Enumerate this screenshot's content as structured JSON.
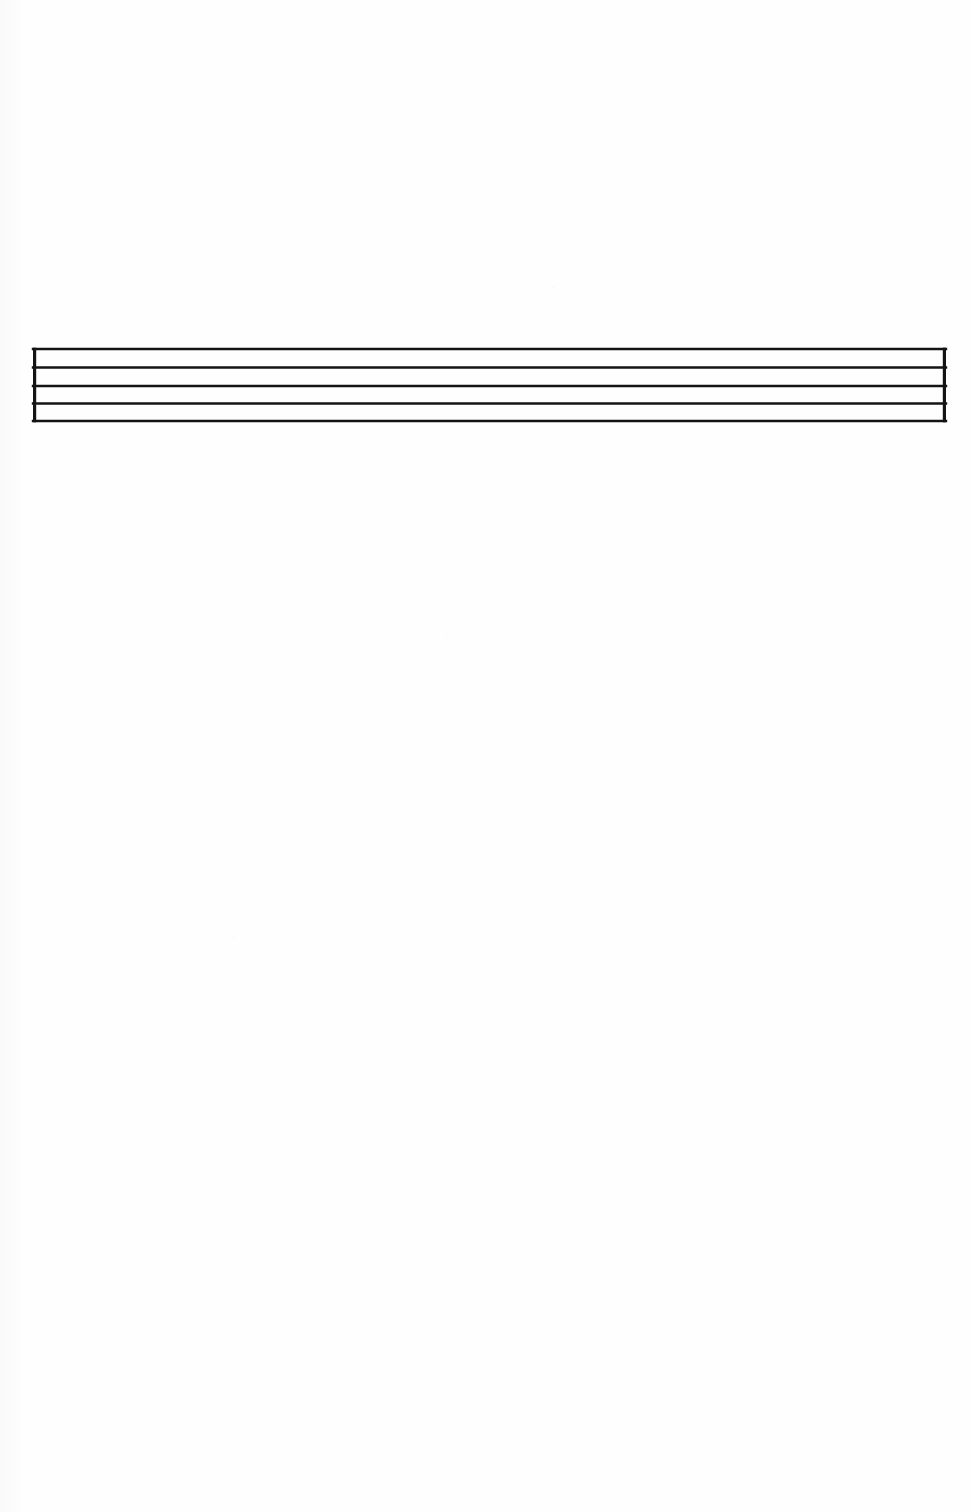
{
  "document": {
    "kind": "scanned-sheet-music-page",
    "page_background_color": "#fefefe",
    "ink_color": "#141414",
    "width": 971,
    "height": 1512,
    "visible_text": "",
    "caption": ""
  },
  "staff": {
    "label": "blank musical staff",
    "line_count": 5,
    "has_left_barline": true,
    "has_right_barline": true,
    "has_clef": false,
    "has_time_signature": false,
    "has_key_signature": false,
    "has_notes": false,
    "has_rests": false,
    "left_x": 33,
    "right_x": 946,
    "top_y": 349,
    "bottom_y": 421,
    "line_thickness": 2.6,
    "barline_thickness": 3.2,
    "line_spacing": 18,
    "line_y_positions": [
      349,
      367.5,
      386,
      403.5,
      421
    ],
    "barline_x_positions": [
      34.6,
      944.4
    ],
    "color": "#141414"
  },
  "chart_data": {
    "type": "line",
    "title": "",
    "xlabel": "",
    "ylabel": "",
    "description": "Empty five-line musical staff (stave) drawn as five horizontal rules closed at both ends by vertical barlines. No clef, key signature, time signature, notes or rests are present.",
    "x": [
      33,
      946
    ],
    "series": [
      {
        "name": "staff-line-5-top",
        "values": [
          349,
          349
        ]
      },
      {
        "name": "staff-line-4",
        "values": [
          367.5,
          367.5
        ]
      },
      {
        "name": "staff-line-3-middle",
        "values": [
          386,
          386
        ]
      },
      {
        "name": "staff-line-2",
        "values": [
          403.5,
          403.5
        ]
      },
      {
        "name": "staff-line-1-bottom",
        "values": [
          421,
          421
        ]
      }
    ],
    "vertical_rules": [
      {
        "name": "left-barline",
        "x": 34.6,
        "y0": 349,
        "y1": 421
      },
      {
        "name": "right-barline",
        "x": 944.4,
        "y0": 349,
        "y1": 421
      }
    ],
    "xlim": [
      0,
      971
    ],
    "ylim": [
      1512,
      0
    ],
    "grid": false,
    "legend": "none"
  }
}
